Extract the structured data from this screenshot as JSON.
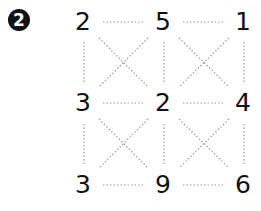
{
  "badge": {
    "label": "2"
  },
  "grid": {
    "rows": [
      [
        "2",
        "5",
        "1"
      ],
      [
        "3",
        "2",
        "4"
      ],
      [
        "3",
        "9",
        "6"
      ]
    ],
    "line_color": "#9a9a9a",
    "number_color": "#111111"
  }
}
